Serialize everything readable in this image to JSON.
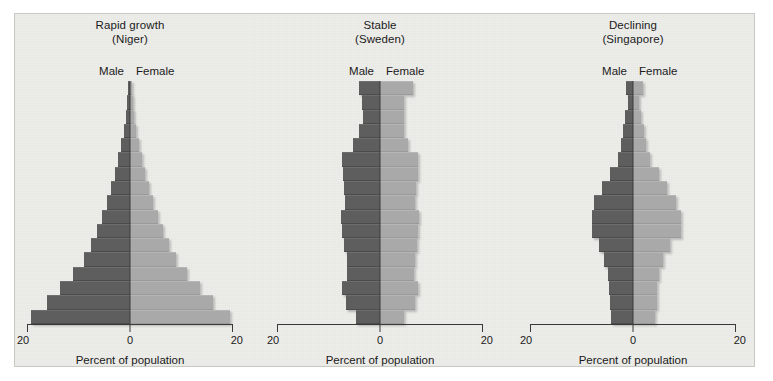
{
  "figure": {
    "axis_title": "Percent of population",
    "male_label": "Male",
    "female_label": "Female",
    "tick_left": "20",
    "tick_mid": "0",
    "tick_right": "20",
    "male_color": "#5e5e5e",
    "female_color": "#a9a9a9",
    "background_color": "#ededea"
  },
  "panels": [
    {
      "title_line1": "Rapid growth",
      "title_line2": "(Niger)"
    },
    {
      "title_line1": "Stable",
      "title_line2": "(Sweden)"
    },
    {
      "title_line1": "Declining",
      "title_line2": "(Singapore)"
    }
  ],
  "chart_data": [
    {
      "type": "bar",
      "title": "Rapid growth (Niger)",
      "subtitle": "(Niger)",
      "orientation": "population-pyramid",
      "xlabel": "Percent of population",
      "ylabel": "",
      "xlim": [
        -20,
        20
      ],
      "xticks": [
        -20,
        0,
        20
      ],
      "xticklabels": [
        "20",
        "0",
        "20"
      ],
      "grid": false,
      "legend": [
        "Male",
        "Female"
      ],
      "legend_position": "top-center",
      "categories": [
        "80+",
        "75-79",
        "70-74",
        "65-69",
        "60-64",
        "55-59",
        "50-54",
        "45-49",
        "40-44",
        "35-39",
        "30-34",
        "25-29",
        "20-24",
        "15-19",
        "10-14",
        "5-9",
        "0-4"
      ],
      "series": [
        {
          "name": "Male",
          "values": [
            0.3,
            0.5,
            0.8,
            1.2,
            1.7,
            2.3,
            3.0,
            3.7,
            4.5,
            5.4,
            6.4,
            7.6,
            9.0,
            11.0,
            13.6,
            16.2,
            19.2
          ]
        },
        {
          "name": "Female",
          "values": [
            0.3,
            0.5,
            0.8,
            1.2,
            1.7,
            2.3,
            3.0,
            3.7,
            4.5,
            5.4,
            6.4,
            7.6,
            9.0,
            11.0,
            13.6,
            16.2,
            19.5
          ]
        }
      ]
    },
    {
      "type": "bar",
      "title": "Stable (Sweden)",
      "subtitle": "(Sweden)",
      "orientation": "population-pyramid",
      "xlabel": "Percent of population",
      "ylabel": "",
      "xlim": [
        -20,
        20
      ],
      "xticks": [
        -20,
        0,
        20
      ],
      "xticklabels": [
        "20",
        "0",
        "20"
      ],
      "grid": false,
      "legend": [
        "Male",
        "Female"
      ],
      "legend_position": "top-center",
      "categories": [
        "80+",
        "75-79",
        "70-74",
        "65-69",
        "60-64",
        "55-59",
        "50-54",
        "45-49",
        "40-44",
        "35-39",
        "30-34",
        "25-29",
        "20-24",
        "15-19",
        "10-14",
        "5-9",
        "0-4"
      ],
      "series": [
        {
          "name": "Male",
          "values": [
            4.1,
            3.5,
            3.4,
            4.1,
            5.3,
            7.3,
            7.2,
            6.9,
            6.8,
            7.5,
            7.3,
            7.0,
            6.4,
            6.4,
            7.3,
            6.7,
            4.6
          ]
        },
        {
          "name": "Female",
          "values": [
            6.5,
            4.6,
            4.6,
            4.7,
            5.4,
            7.4,
            7.3,
            6.9,
            6.8,
            7.5,
            7.3,
            7.1,
            6.7,
            6.6,
            7.3,
            6.7,
            4.6
          ]
        }
      ]
    },
    {
      "type": "bar",
      "title": "Declining (Singapore)",
      "subtitle": "(Singapore)",
      "orientation": "population-pyramid",
      "xlabel": "Percent of population",
      "ylabel": "",
      "xlim": [
        -20,
        20
      ],
      "xticks": [
        -20,
        0,
        20
      ],
      "xticklabels": [
        "20",
        "0",
        "20"
      ],
      "grid": false,
      "legend": [
        "Male",
        "Female"
      ],
      "legend_position": "top-center",
      "categories": [
        "80+",
        "75-79",
        "70-74",
        "65-69",
        "60-64",
        "55-59",
        "50-54",
        "45-49",
        "40-44",
        "35-39",
        "30-34",
        "25-29",
        "20-24",
        "15-19",
        "10-14",
        "5-9",
        "0-4"
      ],
      "series": [
        {
          "name": "Male",
          "values": [
            1.4,
            1.0,
            1.5,
            2.0,
            2.4,
            2.9,
            4.5,
            6.0,
            7.6,
            8.0,
            8.0,
            6.6,
            5.6,
            4.8,
            4.6,
            4.5,
            4.3
          ]
        },
        {
          "name": "Female",
          "values": [
            2.0,
            1.1,
            1.6,
            2.2,
            2.6,
            3.3,
            5.1,
            6.6,
            8.3,
            9.3,
            9.3,
            7.1,
            5.8,
            5.0,
            4.7,
            4.6,
            4.3
          ]
        }
      ]
    }
  ]
}
